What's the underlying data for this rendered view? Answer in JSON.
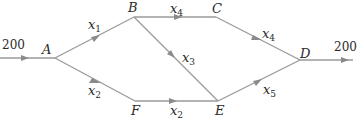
{
  "diagram": {
    "type": "flow-network",
    "nodes": [
      {
        "id": "A",
        "label": "A",
        "x": 55,
        "y": 58
      },
      {
        "id": "B",
        "label": "B",
        "x": 134,
        "y": 17
      },
      {
        "id": "C",
        "label": "C",
        "x": 216,
        "y": 17
      },
      {
        "id": "D",
        "label": "D",
        "x": 300,
        "y": 60
      },
      {
        "id": "E",
        "label": "E",
        "x": 218,
        "y": 101
      },
      {
        "id": "F",
        "label": "F",
        "x": 135,
        "y": 101
      }
    ],
    "edges": [
      {
        "from": "in",
        "to": "A",
        "label": "200"
      },
      {
        "from": "A",
        "to": "B",
        "var": "x",
        "sub": "1"
      },
      {
        "from": "A",
        "to": "F",
        "var": "x",
        "sub": "2"
      },
      {
        "from": "B",
        "to": "C",
        "var": "x",
        "sub": "4"
      },
      {
        "from": "B",
        "to": "E",
        "var": "x",
        "sub": "3"
      },
      {
        "from": "F",
        "to": "E",
        "var": "x",
        "sub": "2"
      },
      {
        "from": "C",
        "to": "D",
        "var": "x",
        "sub": "4"
      },
      {
        "from": "E",
        "to": "D",
        "var": "x",
        "sub": "5"
      },
      {
        "from": "D",
        "to": "out",
        "label": "200"
      }
    ],
    "input_flow": "200",
    "output_flow": "200",
    "colors": {
      "line": "#9a9a9a",
      "text": "#2a2a2a"
    }
  }
}
